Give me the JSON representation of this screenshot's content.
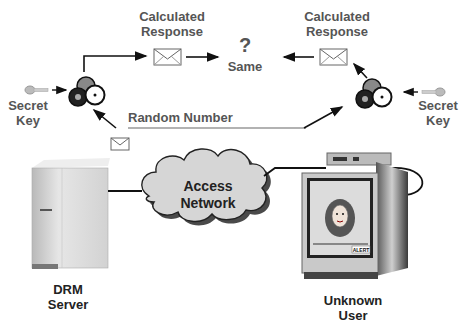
{
  "diagram": {
    "left": {
      "calc_response_line1": "Calculated",
      "calc_response_line2": "Response",
      "secret_key_line1": "Secret",
      "secret_key_line2": "Key"
    },
    "right": {
      "calc_response_line1": "Calculated",
      "calc_response_line2": "Response",
      "secret_key_line1": "Secret",
      "secret_key_line2": "Key"
    },
    "compare": {
      "symbol": "?",
      "label": "Same"
    },
    "random_number": "Random Number",
    "network": {
      "line1": "Access",
      "line2": "Network"
    },
    "server": {
      "line1": "DRM",
      "line2": "Server"
    },
    "user": {
      "line1": "Unknown",
      "line2": "User"
    },
    "tv_badge": "ALERT"
  }
}
